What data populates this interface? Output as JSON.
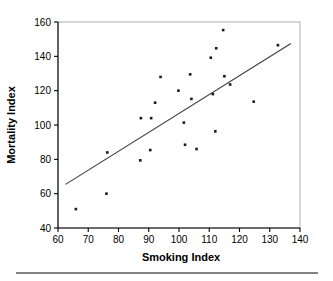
{
  "chart_data": {
    "type": "scatter",
    "title": "",
    "xlabel": "Smoking Index",
    "ylabel": "Mortality Index",
    "xlim": [
      60,
      140
    ],
    "ylim": [
      40,
      160
    ],
    "xticks": [
      60,
      70,
      80,
      90,
      100,
      110,
      120,
      130,
      140
    ],
    "yticks": [
      40,
      60,
      80,
      100,
      120,
      140,
      160
    ],
    "grid": false,
    "legend": null,
    "marker": "square",
    "marker_color": "#1a1a1a",
    "points": [
      {
        "x": 65.9,
        "y": 51.0
      },
      {
        "x": 76.0,
        "y": 60.0
      },
      {
        "x": 76.3,
        "y": 84.0
      },
      {
        "x": 87.2,
        "y": 79.4
      },
      {
        "x": 87.4,
        "y": 104.0
      },
      {
        "x": 90.5,
        "y": 85.4
      },
      {
        "x": 90.8,
        "y": 104.0
      },
      {
        "x": 92.1,
        "y": 113.0
      },
      {
        "x": 93.9,
        "y": 128.0
      },
      {
        "x": 99.8,
        "y": 120.0
      },
      {
        "x": 101.6,
        "y": 101.4
      },
      {
        "x": 102.0,
        "y": 88.5
      },
      {
        "x": 103.7,
        "y": 129.5
      },
      {
        "x": 104.1,
        "y": 115.2
      },
      {
        "x": 105.8,
        "y": 86.0
      },
      {
        "x": 110.5,
        "y": 139.2
      },
      {
        "x": 111.2,
        "y": 118.0
      },
      {
        "x": 112.0,
        "y": 96.3
      },
      {
        "x": 112.3,
        "y": 144.7
      },
      {
        "x": 114.6,
        "y": 155.3
      },
      {
        "x": 115.0,
        "y": 128.4
      },
      {
        "x": 116.9,
        "y": 123.6
      },
      {
        "x": 124.7,
        "y": 113.6
      },
      {
        "x": 132.7,
        "y": 146.5
      }
    ],
    "trendline": {
      "type": "linear",
      "x_start": 62.5,
      "y_start": 65.4,
      "x_end": 137.0,
      "y_end": 147.5,
      "color": "#3a3a3a"
    },
    "axis_color": "#000000",
    "plot_background": "#ffffff"
  },
  "figure": {
    "separator_rule": true
  }
}
